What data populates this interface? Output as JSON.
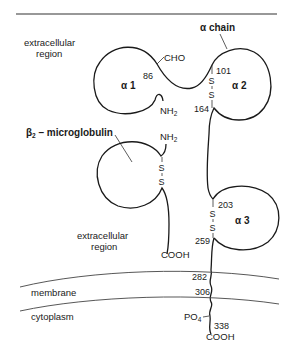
{
  "figure": {
    "title_label": "α chain",
    "regions": {
      "extracellular_top": [
        "extracellular",
        "region"
      ],
      "extracellular_bottom": [
        "extracellular",
        "region"
      ],
      "membrane": "membrane",
      "cytoplasm": "cytoplasm"
    },
    "alpha_chain": {
      "domains": [
        {
          "name": "α 1"
        },
        {
          "name": "α 2"
        },
        {
          "name": "α 3"
        }
      ],
      "residues": {
        "r86": "86",
        "r101": "101",
        "r164": "164",
        "r203": "203",
        "r259": "259",
        "r282": "282",
        "r306": "306",
        "r338": "338"
      },
      "groups": {
        "cho": "CHO",
        "nh2": "NH",
        "nh2_sub": "2",
        "po4": "PO",
        "po4_sub": "4",
        "cooh": "COOH"
      }
    },
    "beta2_microglobulin": {
      "label_main": "β",
      "label_sub": "2",
      "label_rest": " – microglobulin",
      "nh2": "NH",
      "nh2_sub": "2",
      "cooh": "COOH"
    },
    "disulfide": {
      "s": "S"
    }
  }
}
